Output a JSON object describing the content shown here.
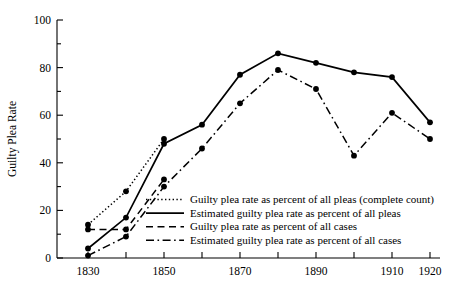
{
  "chart_data": {
    "type": "line",
    "title": "",
    "xlabel": "",
    "ylabel": "Guilty Plea Rate",
    "xlim": [
      1825,
      1925
    ],
    "ylim": [
      0,
      100
    ],
    "grid": false,
    "legend_position": "inside-lower-right",
    "x_ticks": [
      1830,
      1840,
      1850,
      1860,
      1870,
      1880,
      1890,
      1900,
      1910,
      1920
    ],
    "x_tick_labels": [
      "1830",
      "",
      "1850",
      "",
      "1870",
      "",
      "1890",
      "",
      "1910",
      "1920"
    ],
    "y_ticks": [
      0,
      10,
      20,
      30,
      40,
      50,
      60,
      70,
      80,
      90,
      100
    ],
    "y_tick_labels": [
      "0",
      "",
      "20",
      "",
      "40",
      "",
      "60",
      "",
      "80",
      "",
      "100"
    ],
    "series": [
      {
        "name": "Guilty plea rate as percent of all pleas (complete count)",
        "style": "dotted",
        "x": [
          1830,
          1840,
          1850
        ],
        "values": [
          14,
          28,
          50
        ]
      },
      {
        "name": "Estimated guilty plea rate as percent of all pleas",
        "style": "solid",
        "x": [
          1830,
          1840,
          1850,
          1860,
          1870,
          1880,
          1890,
          1900,
          1910,
          1920
        ],
        "values": [
          4,
          17,
          48,
          56,
          77,
          86,
          82,
          78,
          76,
          57
        ]
      },
      {
        "name": "Guilty plea rate as percent of all cases",
        "style": "dashed",
        "x": [
          1830,
          1840,
          1850
        ],
        "values": [
          12,
          12,
          33
        ]
      },
      {
        "name": "Estimated guilty plea rate as percent of all cases",
        "style": "dashdot",
        "x": [
          1830,
          1840,
          1850,
          1860,
          1870,
          1880,
          1890,
          1900,
          1910,
          1920
        ],
        "values": [
          1,
          9,
          30,
          46,
          65,
          79,
          71,
          43,
          61,
          50
        ]
      }
    ]
  },
  "legend": {
    "entries": [
      {
        "label": "Guilty plea rate as percent of all pleas (complete count)",
        "style": "dotted"
      },
      {
        "label": "Estimated guilty plea rate as percent of all pleas",
        "style": "solid"
      },
      {
        "label": "Guilty plea rate as percent of all cases",
        "style": "dashed"
      },
      {
        "label": "Estimated guilty plea rate as percent of all cases",
        "style": "dashdot"
      }
    ]
  },
  "axes": {
    "y_title": "Guilty Plea Rate"
  }
}
